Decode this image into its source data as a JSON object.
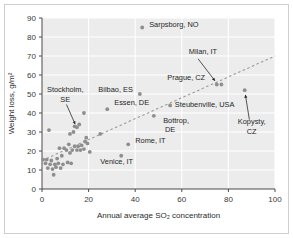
{
  "figure": {
    "background_color": "#ffffff",
    "plot_background_color": "#ececec",
    "gridline_color": "#ffffff",
    "point_color": "#8e8e8e",
    "trendline_color": "#9a9a9a",
    "axis_color": "#4a4a4a"
  },
  "chart_data": {
    "type": "scatter",
    "title": "",
    "subtitle": "",
    "xlabel": "Annual average SO2 concentration",
    "xlabel_display": "Annual average SO₂ concentration",
    "ylabel": "Weight loss, g/m2",
    "ylabel_display": "Weight loss, g/m²",
    "xlim": [
      0,
      100
    ],
    "ylim": [
      0,
      90
    ],
    "xticks": [
      0,
      20,
      40,
      60,
      80,
      100
    ],
    "yticks": [
      0,
      10,
      20,
      30,
      40,
      50,
      60,
      70,
      80,
      90
    ],
    "xtick_labels": [
      "0",
      "20",
      "40",
      "60",
      "80",
      "100"
    ],
    "ytick_labels": [
      "0",
      "10",
      "20",
      "30",
      "40",
      "50",
      "60",
      "70",
      "80",
      "90"
    ],
    "grid": true,
    "legend": false,
    "legend_position": "none",
    "trendline": {
      "present": true,
      "style": "dashed",
      "x_start": 0,
      "y_start": 15,
      "x_end": 100,
      "y_end": 70
    },
    "points": [
      {
        "x": 43,
        "y": 85,
        "label": "Sarpsborg, NO"
      },
      {
        "x": 75,
        "y": 55,
        "label": "Milan, IT"
      },
      {
        "x": 77,
        "y": 55,
        "label": "Prague, CZ"
      },
      {
        "x": 87,
        "y": 52,
        "label": "Kopysty, CZ"
      },
      {
        "x": 42,
        "y": 50,
        "label": "Bilbao, ES"
      },
      {
        "x": 28,
        "y": 42,
        "label": "Essen, DE"
      },
      {
        "x": 55,
        "y": 44,
        "label": "Steubenville, USA"
      },
      {
        "x": 48,
        "y": 38.5,
        "label": "Bottrop, DE"
      },
      {
        "x": 37,
        "y": 23.5,
        "label": "Rome, IT"
      },
      {
        "x": 34,
        "y": 17.5,
        "label": "Venice, IT"
      },
      {
        "x": 15,
        "y": 32.5,
        "label": "Stockholm, SE"
      },
      {
        "x": 3,
        "y": 31,
        "label": ""
      },
      {
        "x": 18,
        "y": 40,
        "label": ""
      },
      {
        "x": 16,
        "y": 34,
        "label": ""
      },
      {
        "x": 14,
        "y": 33,
        "label": ""
      },
      {
        "x": 12,
        "y": 29,
        "label": ""
      },
      {
        "x": 25,
        "y": 29,
        "label": ""
      },
      {
        "x": 19,
        "y": 27,
        "label": ""
      },
      {
        "x": 13.5,
        "y": 30,
        "label": ""
      },
      {
        "x": 18.5,
        "y": 25,
        "label": ""
      },
      {
        "x": 19.5,
        "y": 24,
        "label": ""
      },
      {
        "x": 17,
        "y": 23,
        "label": ""
      },
      {
        "x": 15.5,
        "y": 22.5,
        "label": ""
      },
      {
        "x": 14,
        "y": 22.5,
        "label": ""
      },
      {
        "x": 11.5,
        "y": 23.5,
        "label": ""
      },
      {
        "x": 7.5,
        "y": 21.5,
        "label": ""
      },
      {
        "x": 9.5,
        "y": 21.5,
        "label": ""
      },
      {
        "x": 10.5,
        "y": 20.5,
        "label": ""
      },
      {
        "x": 13,
        "y": 20.5,
        "label": ""
      },
      {
        "x": 15,
        "y": 20.5,
        "label": ""
      },
      {
        "x": 16.5,
        "y": 20.5,
        "label": ""
      },
      {
        "x": 18,
        "y": 21,
        "label": ""
      },
      {
        "x": 20.5,
        "y": 19.5,
        "label": ""
      },
      {
        "x": 12,
        "y": 19,
        "label": ""
      },
      {
        "x": 8.5,
        "y": 17.5,
        "label": ""
      },
      {
        "x": 6.5,
        "y": 16,
        "label": ""
      },
      {
        "x": 4,
        "y": 15,
        "label": ""
      },
      {
        "x": 2,
        "y": 15.5,
        "label": ""
      },
      {
        "x": 0.5,
        "y": 15.5,
        "label": ""
      },
      {
        "x": 1.5,
        "y": 13.5,
        "label": ""
      },
      {
        "x": 3.5,
        "y": 13,
        "label": ""
      },
      {
        "x": 5.5,
        "y": 13,
        "label": ""
      },
      {
        "x": 7,
        "y": 13.5,
        "label": ""
      },
      {
        "x": 9,
        "y": 13,
        "label": ""
      },
      {
        "x": 11,
        "y": 14,
        "label": ""
      },
      {
        "x": 12.5,
        "y": 13.5,
        "label": ""
      },
      {
        "x": 2.5,
        "y": 11,
        "label": ""
      },
      {
        "x": 4.5,
        "y": 10.5,
        "label": ""
      },
      {
        "x": 6,
        "y": 11.5,
        "label": ""
      },
      {
        "x": 8,
        "y": 11,
        "label": ""
      },
      {
        "x": 5,
        "y": 7.5,
        "label": ""
      }
    ],
    "annotations": [
      {
        "text": "Sarpsborg, NO",
        "x": 46,
        "y": 85.5,
        "anchor": "start",
        "arrow": false
      },
      {
        "text": "Milan, IT",
        "x": 63,
        "y": 71,
        "anchor": "start",
        "arrow": true
      },
      {
        "text": "Prague, CZ",
        "x": 70,
        "y": 57.5,
        "anchor": "end",
        "arrow": false
      },
      {
        "text": "Kopysty,",
        "x": 90,
        "y": 34,
        "anchor": "middle",
        "arrow": true
      },
      {
        "text": "CZ",
        "x": 90,
        "y": 29,
        "anchor": "middle",
        "arrow": false
      },
      {
        "text": "Bilbao, ES",
        "x": 39,
        "y": 51,
        "anchor": "end",
        "arrow": false
      },
      {
        "text": "Essen, DE",
        "x": 31,
        "y": 44,
        "anchor": "start",
        "arrow": false
      },
      {
        "text": "Steubenville, USA",
        "x": 57,
        "y": 43,
        "anchor": "start",
        "arrow": false
      },
      {
        "text": "Bottrop,",
        "x": 52,
        "y": 35,
        "anchor": "start",
        "arrow": false
      },
      {
        "text": "DE",
        "x": 55,
        "y": 30,
        "anchor": "middle",
        "arrow": false
      },
      {
        "text": "Rome, IT",
        "x": 40,
        "y": 24,
        "anchor": "start",
        "arrow": false
      },
      {
        "text": "Venice, IT",
        "x": 25,
        "y": 13,
        "anchor": "start",
        "arrow": false
      },
      {
        "text": "Stockholm,",
        "x": 10,
        "y": 51,
        "anchor": "middle",
        "arrow": true
      },
      {
        "text": "SE",
        "x": 10,
        "y": 46,
        "anchor": "middle",
        "arrow": false
      }
    ],
    "arrows": [
      {
        "name": "stockholm-arrow",
        "x1": 10.5,
        "y1": 44.5,
        "x2": 14.2,
        "y2": 34.2
      },
      {
        "name": "milan-arrow",
        "x1": 67,
        "y1": 68.5,
        "x2": 74.2,
        "y2": 57
      },
      {
        "name": "kopysty-arrow",
        "x1": 89,
        "y1": 36.5,
        "x2": 87.3,
        "y2": 49.5
      }
    ]
  }
}
